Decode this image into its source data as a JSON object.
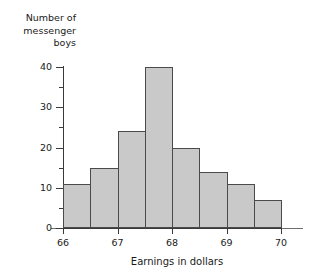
{
  "artifact": {
    "top_text": ""
  },
  "chart_data": {
    "type": "bar",
    "title": "",
    "xlabel": "Earnings in dollars",
    "ylabel": "Number of messenger boys",
    "ylabel_lines": [
      "Number of",
      "messenger",
      "boys"
    ],
    "categories": [
      "66.0-66.5",
      "66.5-67.0",
      "67.0-67.5",
      "67.5-68.0",
      "68.0-68.5",
      "68.5-69.0",
      "69.0-69.5",
      "69.5-70.0"
    ],
    "bin_edges": [
      66.0,
      66.5,
      67.0,
      67.5,
      68.0,
      68.5,
      69.0,
      69.5,
      70.0
    ],
    "values": [
      11,
      15,
      24,
      40,
      20,
      14,
      11,
      7
    ],
    "xlim": [
      66,
      70
    ],
    "ylim": [
      0,
      40
    ],
    "x_tick_labels": [
      "66",
      "67",
      "68",
      "69",
      "70"
    ],
    "x_tick_values": [
      66,
      67,
      68,
      69,
      70
    ],
    "y_tick_labels": [
      "0",
      "10",
      "20",
      "30",
      "40"
    ],
    "y_tick_values": [
      0,
      10,
      20,
      30,
      40
    ],
    "y_minor_tick_values": [
      5,
      15,
      25,
      35
    ],
    "grid": false,
    "legend": null,
    "bar_fill_color": "#c9c9c9",
    "bar_edge_color": "#4a4a4a",
    "axis_color": "#3a3a3a"
  }
}
